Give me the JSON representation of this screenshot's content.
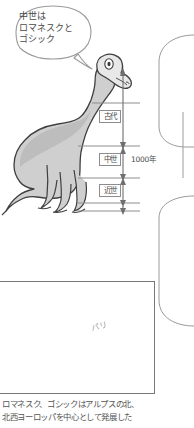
{
  "speech_bubble": {
    "text": "中世は\nロマネスクと\nゴシック"
  },
  "timeline": {
    "eras": [
      {
        "label": "古代"
      },
      {
        "label": "中世"
      },
      {
        "label": "近世"
      }
    ],
    "span_label": "1000年"
  },
  "map": {
    "city_label": "パリ"
  },
  "caption": {
    "text": "ロマネスク、ゴシックはアルプスの北、\n北西ヨーロッパを中心として発展した"
  },
  "colors": {
    "ink": "#4a4a4a",
    "line": "#8d8d8d",
    "dino_body": "#cfcfcf",
    "dino_shadow": "#b4b4b4",
    "map_land_line": "#6f6f6f",
    "map_highlight": "#ececec"
  }
}
